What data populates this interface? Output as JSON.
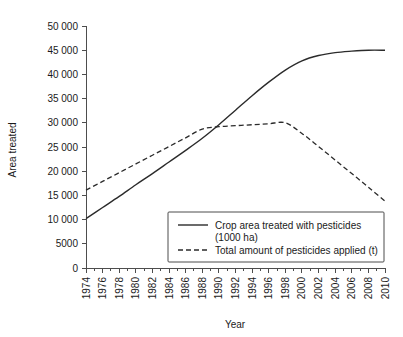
{
  "chart_data": {
    "type": "line",
    "title": "",
    "xlabel": "Year",
    "ylabel": "Area treated",
    "xlim": [
      1974,
      2010
    ],
    "ylim": [
      0,
      50000
    ],
    "grid": false,
    "legend_position": "inside-bottom-center",
    "y_ticks": [
      0,
      5000,
      10000,
      15000,
      20000,
      25000,
      30000,
      35000,
      40000,
      45000,
      50000
    ],
    "y_tick_labels": [
      "0",
      "5000",
      "10 000",
      "15 000",
      "20 000",
      "25 000",
      "30 000",
      "35 000",
      "40 000",
      "45 000",
      "50 000"
    ],
    "x_ticks": [
      1974,
      1976,
      1978,
      1980,
      1982,
      1984,
      1986,
      1988,
      1990,
      1992,
      1994,
      1996,
      1998,
      2000,
      2002,
      2004,
      2006,
      2008,
      2010
    ],
    "x_tick_labels": [
      "1974",
      "1976",
      "1978",
      "1980",
      "1982",
      "1984",
      "1986",
      "1988",
      "1990",
      "1992",
      "1994",
      "1996",
      "1998",
      "2000",
      "2002",
      "2004",
      "2006",
      "2008",
      "2010"
    ],
    "x_minor_ticks": [
      1975,
      1977,
      1979,
      1981,
      1983,
      1985,
      1987,
      1989,
      1991,
      1993,
      1995,
      1997,
      1999,
      2001,
      2003,
      2005,
      2007,
      2009
    ],
    "series": [
      {
        "name": "Crop area treated with pesticides (1000 ha)",
        "style": "solid",
        "x": [
          1974,
          1976,
          1978,
          1980,
          1982,
          1984,
          1986,
          1988,
          1990,
          1992,
          1994,
          1996,
          1998,
          2000,
          2002,
          2004,
          2006,
          2008,
          2010
        ],
        "values": [
          10200,
          12500,
          14800,
          17200,
          19500,
          21900,
          24300,
          26800,
          29600,
          32600,
          35600,
          38400,
          40900,
          42800,
          43900,
          44500,
          44800,
          45000,
          45000
        ]
      },
      {
        "name": "Total amount of pesticides applied (t)",
        "style": "dashed",
        "x": [
          1974,
          1976,
          1978,
          1980,
          1982,
          1984,
          1986,
          1988,
          1990,
          1992,
          1994,
          1996,
          1998,
          2000,
          2002,
          2004,
          2006,
          2008,
          2010
        ],
        "values": [
          16100,
          17900,
          19700,
          21500,
          23300,
          25100,
          26900,
          28700,
          29200,
          29400,
          29600,
          29800,
          30000,
          27800,
          25100,
          22300,
          19500,
          16700,
          13800
        ]
      }
    ]
  },
  "legend": {
    "entries": [
      {
        "label_line1": "Crop area treated with pesticides",
        "label_line2": "(1000 ha)",
        "style": "solid"
      },
      {
        "label_line1": "Total amount of pesticides applied (t)",
        "label_line2": "",
        "style": "dashed"
      }
    ]
  },
  "colors": {
    "line": "#2b2b2b",
    "axis": "#4d4d4d",
    "text": "#1a1a1a",
    "background": "#ffffff"
  }
}
